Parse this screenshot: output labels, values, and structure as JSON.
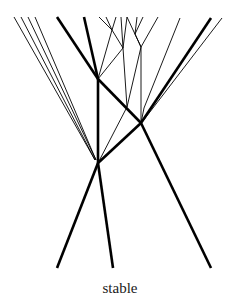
{
  "diagram": {
    "caption": "stable",
    "stroke_color": "#000000",
    "thick_width": 2.6,
    "thin_width": 0.9,
    "nodes": {
      "A": [
        98,
        79
      ],
      "B": [
        141,
        123
      ],
      "C": [
        98,
        163
      ]
    },
    "thick_lines": [
      [
        [
          57,
          17
        ],
        [
          98,
          79
        ]
      ],
      [
        [
          98,
          79
        ],
        [
          141,
          123
        ]
      ],
      [
        [
          141,
          123
        ],
        [
          211,
          268
        ]
      ],
      [
        [
          84,
          17
        ],
        [
          98,
          79
        ]
      ],
      [
        [
          98,
          79
        ],
        [
          98,
          163
        ]
      ],
      [
        [
          211,
          18
        ],
        [
          141,
          123
        ]
      ],
      [
        [
          141,
          123
        ],
        [
          98,
          163
        ]
      ],
      [
        [
          98,
          163
        ],
        [
          57,
          268
        ]
      ],
      [
        [
          98,
          163
        ],
        [
          113,
          268
        ]
      ]
    ],
    "thin_lines": [
      [
        [
          14,
          17
        ],
        [
          95,
          160
        ]
      ],
      [
        [
          21,
          17
        ],
        [
          95,
          160
        ]
      ],
      [
        [
          28,
          17
        ],
        [
          96,
          160
        ]
      ],
      [
        [
          35,
          17
        ],
        [
          96,
          160
        ]
      ],
      [
        [
          99,
          17
        ],
        [
          112,
          30
        ]
      ],
      [
        [
          106,
          17
        ],
        [
          112,
          30
        ]
      ],
      [
        [
          112,
          30
        ],
        [
          123,
          48
        ]
      ],
      [
        [
          116,
          17
        ],
        [
          112,
          30
        ]
      ],
      [
        [
          112,
          30
        ],
        [
          98,
          79
        ]
      ],
      [
        [
          121,
          17
        ],
        [
          123,
          48
        ]
      ],
      [
        [
          127,
          17
        ],
        [
          123,
          48
        ]
      ],
      [
        [
          123,
          48
        ],
        [
          98,
          79
        ]
      ],
      [
        [
          123,
          48
        ],
        [
          127,
          107
        ]
      ],
      [
        [
          127,
          107
        ],
        [
          98,
          163
        ]
      ],
      [
        [
          137,
          17
        ],
        [
          135,
          34
        ]
      ],
      [
        [
          143,
          17
        ],
        [
          135,
          34
        ]
      ],
      [
        [
          135,
          34
        ],
        [
          141,
          47
        ]
      ],
      [
        [
          127,
          17
        ],
        [
          141,
          47
        ]
      ],
      [
        [
          158,
          17
        ],
        [
          141,
          47
        ]
      ],
      [
        [
          141,
          47
        ],
        [
          141,
          123
        ]
      ],
      [
        [
          141,
          47
        ],
        [
          127,
          107
        ]
      ],
      [
        [
          180,
          18
        ],
        [
          144,
          108
        ]
      ],
      [
        [
          144,
          108
        ],
        [
          141,
          123
        ]
      ],
      [
        [
          222,
          18
        ],
        [
          143,
          121
        ]
      ]
    ]
  }
}
